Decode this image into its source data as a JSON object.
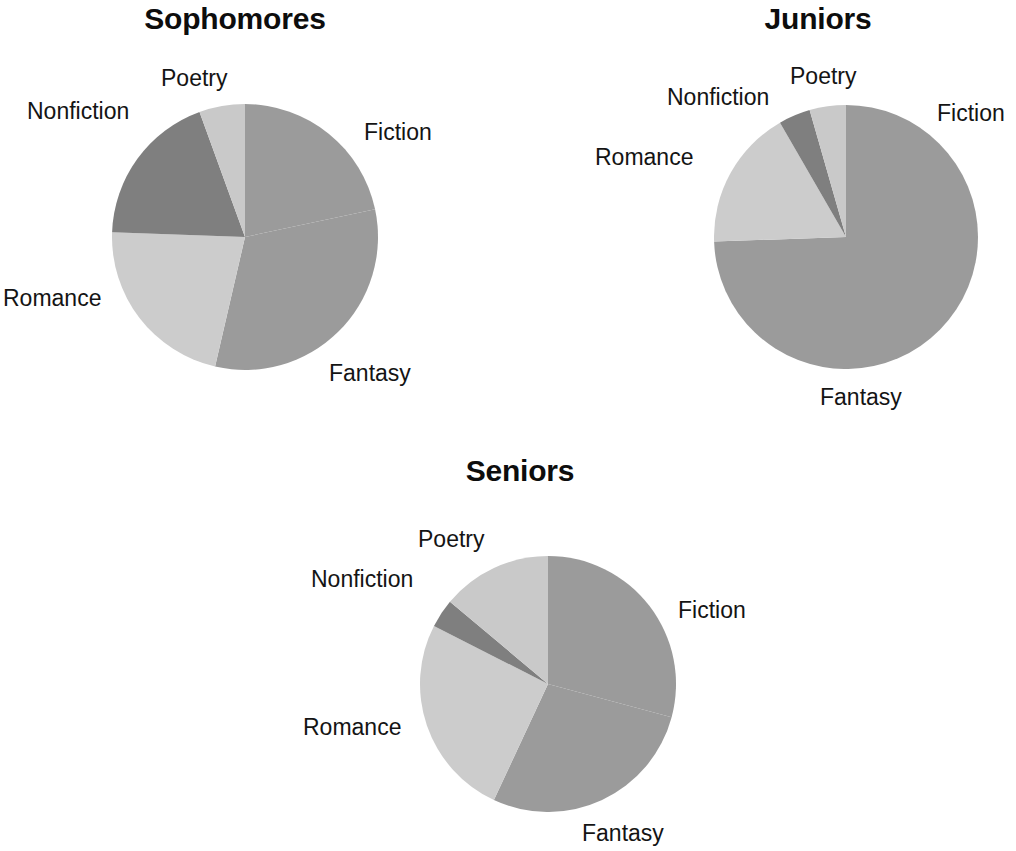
{
  "page": {
    "background_color": "#ffffff",
    "text_color": "#141414"
  },
  "palette": {
    "fiction": "#9b9b9b",
    "fantasy": "#9b9b9b",
    "romance": "#cccccc",
    "nonfiction": "#7f7f7f",
    "poetry": "#c9c9c9"
  },
  "charts": [
    {
      "id": "sophomores",
      "title": "Sophomores",
      "labels": {
        "fiction": "Fiction",
        "fantasy": "Fantasy",
        "romance": "Romance",
        "nonfiction": "Nonfiction",
        "poetry": "Poetry"
      }
    },
    {
      "id": "juniors",
      "title": "Juniors",
      "labels": {
        "fiction": "Fiction",
        "fantasy": "Fantasy",
        "romance": "Romance",
        "nonfiction": "Nonfiction",
        "poetry": "Poetry"
      }
    },
    {
      "id": "seniors",
      "title": "Seniors",
      "labels": {
        "fiction": "Fiction",
        "fantasy": "Fantasy",
        "romance": "Romance",
        "nonfiction": "Nonfiction",
        "poetry": "Poetry"
      }
    }
  ],
  "chart_data": [
    {
      "type": "pie",
      "title": "Sophomores",
      "categories": [
        "Fiction",
        "Fantasy",
        "Romance",
        "Nonfiction",
        "Poetry"
      ],
      "values": [
        22,
        32,
        22,
        19,
        5
      ],
      "units": "percent",
      "start_angle_deg": 0,
      "direction": "clockwise",
      "colors": [
        "#9b9b9b",
        "#9b9b9b",
        "#cccccc",
        "#7f7f7f",
        "#c9c9c9"
      ],
      "slice_angles_deg": [
        {
          "name": "Fiction",
          "start": 0,
          "end": 78
        },
        {
          "name": "Fantasy",
          "start": 78,
          "end": 193
        },
        {
          "name": "Romance",
          "start": 193,
          "end": 272
        },
        {
          "name": "Nonfiction",
          "start": 272,
          "end": 340
        },
        {
          "name": "Poetry",
          "start": 340,
          "end": 360
        }
      ],
      "legend": "none",
      "labels_position": "outside",
      "grid": false,
      "center_px": [
        245,
        237
      ],
      "radius_px": 133
    },
    {
      "type": "pie",
      "title": "Juniors",
      "categories": [
        "Fiction",
        "Fantasy",
        "Romance",
        "Nonfiction",
        "Poetry"
      ],
      "values": [
        25,
        49,
        17,
        4,
        5
      ],
      "units": "percent",
      "start_angle_deg": 0,
      "direction": "clockwise",
      "colors": [
        "#9b9b9b",
        "#9b9b9b",
        "#cccccc",
        "#7f7f7f",
        "#c9c9c9"
      ],
      "slice_angles_deg": [
        {
          "name": "Fiction",
          "start": 0,
          "end": 90
        },
        {
          "name": "Fantasy",
          "start": 90,
          "end": 268
        },
        {
          "name": "Romance",
          "start": 268,
          "end": 330
        },
        {
          "name": "Nonfiction",
          "start": 330,
          "end": 344
        },
        {
          "name": "Poetry",
          "start": 344,
          "end": 360
        }
      ],
      "legend": "none",
      "labels_position": "outside",
      "grid": false,
      "center_px": [
        846,
        238
      ],
      "radius_px": 132
    },
    {
      "type": "pie",
      "title": "Seniors",
      "categories": [
        "Fiction",
        "Fantasy",
        "Romance",
        "Nonfiction",
        "Poetry"
      ],
      "values": [
        29,
        28,
        25,
        4,
        14
      ],
      "units": "percent",
      "start_angle_deg": 0,
      "direction": "clockwise",
      "colors": [
        "#9b9b9b",
        "#9b9b9b",
        "#cccccc",
        "#7f7f7f",
        "#c9c9c9"
      ],
      "slice_angles_deg": [
        {
          "name": "Fiction",
          "start": 0,
          "end": 105
        },
        {
          "name": "Fantasy",
          "start": 105,
          "end": 205
        },
        {
          "name": "Romance",
          "start": 205,
          "end": 297
        },
        {
          "name": "Nonfiction",
          "start": 297,
          "end": 310
        },
        {
          "name": "Poetry",
          "start": 310,
          "end": 360
        }
      ],
      "legend": "none",
      "labels_position": "outside",
      "grid": false,
      "center_px": [
        548,
        686
      ],
      "radius_px": 128
    }
  ]
}
